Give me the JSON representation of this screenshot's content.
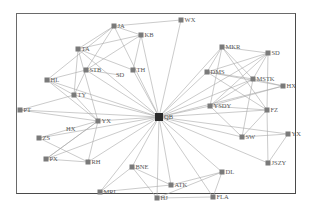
{
  "diagram": {
    "type": "network-graph",
    "colors": {
      "edge": "#a8a8a8",
      "node": "#7a7a7a",
      "hub": "#2a2a2a",
      "label": "#555555",
      "frame": "#555555"
    },
    "hub": "QB",
    "nodes": [
      {
        "id": "QB",
        "label": "QB",
        "x": 159,
        "y": 117,
        "hub": true
      },
      {
        "id": "JA",
        "label": "JA",
        "x": 114,
        "y": 26
      },
      {
        "id": "KB",
        "label": "KB",
        "x": 141,
        "y": 35
      },
      {
        "id": "WX",
        "label": "WX",
        "x": 181,
        "y": 20
      },
      {
        "id": "TA",
        "label": "TA",
        "x": 78,
        "y": 49
      },
      {
        "id": "STB",
        "label": "STB",
        "x": 86,
        "y": 70
      },
      {
        "id": "SDL",
        "label": "SD",
        "x": 120,
        "y": 75,
        "labelOnly": true
      },
      {
        "id": "TH",
        "label": "TH",
        "x": 133,
        "y": 70
      },
      {
        "id": "HL",
        "label": "HL",
        "x": 47,
        "y": 80
      },
      {
        "id": "TY",
        "label": "TY",
        "x": 74,
        "y": 95
      },
      {
        "id": "PT",
        "label": "PT",
        "x": 20,
        "y": 110
      },
      {
        "id": "YXL",
        "label": "YX",
        "x": 98,
        "y": 121
      },
      {
        "id": "HXL",
        "label": "HX",
        "x": 70,
        "y": 129,
        "labelOnly": true
      },
      {
        "id": "ZS",
        "label": "ZS",
        "x": 39,
        "y": 138
      },
      {
        "id": "PX",
        "label": "PX",
        "x": 46,
        "y": 159
      },
      {
        "id": "RH",
        "label": "RH",
        "x": 88,
        "y": 162
      },
      {
        "id": "BNE",
        "label": "BNE",
        "x": 132,
        "y": 167
      },
      {
        "id": "MRL",
        "label": "MRL",
        "x": 100,
        "y": 192
      },
      {
        "id": "ATK",
        "label": "ATK",
        "x": 171,
        "y": 185
      },
      {
        "id": "HJ",
        "label": "HJ",
        "x": 157,
        "y": 198
      },
      {
        "id": "DL",
        "label": "DL",
        "x": 222,
        "y": 172
      },
      {
        "id": "FLA",
        "label": "FLA",
        "x": 213,
        "y": 197
      },
      {
        "id": "MKR",
        "label": "MKR",
        "x": 222,
        "y": 47
      },
      {
        "id": "SDR",
        "label": "SD",
        "x": 268,
        "y": 53
      },
      {
        "id": "DMS",
        "label": "DMS",
        "x": 207,
        "y": 72
      },
      {
        "id": "MSTK",
        "label": "MSTK",
        "x": 253,
        "y": 79
      },
      {
        "id": "HXR",
        "label": "HX",
        "x": 283,
        "y": 86
      },
      {
        "id": "YSDY",
        "label": "YSDY",
        "x": 210,
        "y": 106
      },
      {
        "id": "FZ",
        "label": "FZ",
        "x": 267,
        "y": 110
      },
      {
        "id": "SW",
        "label": "SW",
        "x": 242,
        "y": 137
      },
      {
        "id": "YXR",
        "label": "YX",
        "x": 288,
        "y": 134
      },
      {
        "id": "JSZY",
        "label": "JSZY",
        "x": 268,
        "y": 163
      }
    ],
    "edges": [
      [
        "QB",
        "JA"
      ],
      [
        "QB",
        "KB"
      ],
      [
        "QB",
        "WX"
      ],
      [
        "QB",
        "TA"
      ],
      [
        "QB",
        "STB"
      ],
      [
        "QB",
        "TH"
      ],
      [
        "QB",
        "HL"
      ],
      [
        "QB",
        "TY"
      ],
      [
        "QB",
        "PT"
      ],
      [
        "QB",
        "YXL"
      ],
      [
        "QB",
        "PX"
      ],
      [
        "QB",
        "RH"
      ],
      [
        "QB",
        "BNE"
      ],
      [
        "QB",
        "MRL"
      ],
      [
        "QB",
        "ATK"
      ],
      [
        "QB",
        "HJ"
      ],
      [
        "QB",
        "DL"
      ],
      [
        "QB",
        "FLA"
      ],
      [
        "QB",
        "MKR"
      ],
      [
        "QB",
        "SDR"
      ],
      [
        "QB",
        "DMS"
      ],
      [
        "QB",
        "MSTK"
      ],
      [
        "QB",
        "HXR"
      ],
      [
        "QB",
        "YSDY"
      ],
      [
        "QB",
        "FZ"
      ],
      [
        "QB",
        "SW"
      ],
      [
        "QB",
        "YXR"
      ],
      [
        "QB",
        "JSZY"
      ],
      [
        "QB",
        "ZS"
      ],
      [
        "JA",
        "WX"
      ],
      [
        "JA",
        "KB"
      ],
      [
        "JA",
        "TA"
      ],
      [
        "JA",
        "HL"
      ],
      [
        "JA",
        "STB"
      ],
      [
        "KB",
        "TA"
      ],
      [
        "KB",
        "STB"
      ],
      [
        "KB",
        "TH"
      ],
      [
        "TA",
        "TH"
      ],
      [
        "TA",
        "TY"
      ],
      [
        "TA",
        "YXL"
      ],
      [
        "STB",
        "SDL"
      ],
      [
        "STB",
        "TY"
      ],
      [
        "STB",
        "HL"
      ],
      [
        "HL",
        "YXL"
      ],
      [
        "HL",
        "TY"
      ],
      [
        "TY",
        "PT"
      ],
      [
        "TY",
        "YXL"
      ],
      [
        "PT",
        "YXL"
      ],
      [
        "YXL",
        "HXL"
      ],
      [
        "HXL",
        "ZS"
      ],
      [
        "YXL",
        "RH"
      ],
      [
        "YXL",
        "PX"
      ],
      [
        "ZS",
        "RH"
      ],
      [
        "PX",
        "RH"
      ],
      [
        "PX",
        "YXL"
      ],
      [
        "BNE",
        "MRL"
      ],
      [
        "BNE",
        "HJ"
      ],
      [
        "BNE",
        "ATK"
      ],
      [
        "MRL",
        "ATK"
      ],
      [
        "ATK",
        "DL"
      ],
      [
        "HJ",
        "DL"
      ],
      [
        "HJ",
        "FLA"
      ],
      [
        "DL",
        "FLA"
      ],
      [
        "MKR",
        "SDR"
      ],
      [
        "MKR",
        "DMS"
      ],
      [
        "MKR",
        "MSTK"
      ],
      [
        "MKR",
        "YSDY"
      ],
      [
        "MKR",
        "FZ"
      ],
      [
        "SDR",
        "DMS"
      ],
      [
        "SDR",
        "MSTK"
      ],
      [
        "SDR",
        "YSDY"
      ],
      [
        "SDR",
        "FZ"
      ],
      [
        "DMS",
        "MSTK"
      ],
      [
        "DMS",
        "HXR"
      ],
      [
        "DMS",
        "FZ"
      ],
      [
        "MSTK",
        "HXR"
      ],
      [
        "MSTK",
        "YSDY"
      ],
      [
        "MSTK",
        "SW"
      ],
      [
        "YSDY",
        "FZ"
      ],
      [
        "YSDY",
        "SW"
      ],
      [
        "FZ",
        "SW"
      ],
      [
        "FZ",
        "JSZY"
      ],
      [
        "SW",
        "YXR"
      ],
      [
        "YXR",
        "JSZY"
      ],
      [
        "HXR",
        "YSDY"
      ]
    ]
  }
}
